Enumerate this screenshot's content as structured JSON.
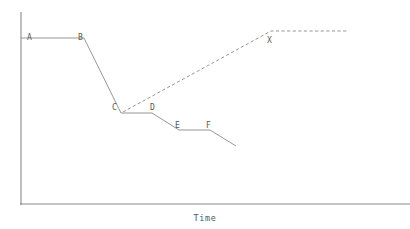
{
  "chart_data": {
    "type": "line",
    "title": "",
    "subtitle": "",
    "xlabel": "Time",
    "ylabel": "",
    "xlim": [
      0,
      410
    ],
    "ylim": [
      0,
      229
    ],
    "grid": false,
    "legend": null,
    "axis_color": "#8a8a8a",
    "line_color": "#8a8a8a",
    "label_color": "#585858",
    "background": "#ffffff",
    "axes": {
      "y_axis": {
        "x": 21,
        "y_top": 12,
        "y_bottom": 205
      },
      "x_axis": {
        "y": 204,
        "x_left": 20,
        "x_right": 410
      }
    },
    "annotations": [
      {
        "text": "A",
        "x": 27,
        "y": 33,
        "point": [
          21,
          38
        ]
      },
      {
        "text": "B",
        "x": 78,
        "y": 33,
        "point": [
          84,
          38
        ]
      },
      {
        "text": "C",
        "x": 112,
        "y": 103,
        "point": [
          121,
          113
        ]
      },
      {
        "text": "D",
        "x": 150,
        "y": 103,
        "point": [
          152,
          113
        ]
      },
      {
        "text": "E",
        "x": 175,
        "y": 121,
        "point": [
          179,
          130
        ]
      },
      {
        "text": "F",
        "x": 206,
        "y": 121,
        "point": [
          210,
          130
        ]
      },
      {
        "text": "X",
        "x": 267,
        "y": 36,
        "point": [
          271,
          31
        ]
      }
    ],
    "series": [
      {
        "name": "decline-path",
        "style": "solid",
        "color": "#8a8a8a",
        "points": [
          [
            21,
            38
          ],
          [
            84,
            38
          ],
          [
            121,
            113
          ],
          [
            152,
            113
          ],
          [
            179,
            130
          ],
          [
            210,
            130
          ],
          [
            236,
            146
          ]
        ]
      },
      {
        "name": "recovery-path",
        "style": "dashed",
        "color": "#8a8a8a",
        "points": [
          [
            123,
            112
          ],
          [
            271,
            31
          ],
          [
            347,
            31
          ]
        ]
      }
    ]
  },
  "figure": {
    "xlabel": "Time",
    "labels": {
      "a": "A",
      "b": "B",
      "c": "C",
      "d": "D",
      "e": "E",
      "f": "F",
      "x": "X"
    }
  }
}
